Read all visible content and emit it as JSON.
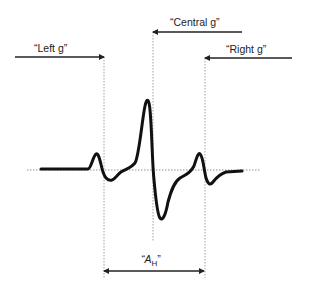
{
  "diagram": {
    "type": "waveform-annotation",
    "labels": {
      "left_g": "“Left g”",
      "central_g": "“Central g”",
      "right_g": "“Right g”",
      "a_h_open": "“A",
      "a_h_sub": "H",
      "a_h_close": "”"
    },
    "regions": [
      {
        "name": "Left g",
        "arrow_direction": "right",
        "boundary": "left-dotted-line"
      },
      {
        "name": "Central g",
        "arrow_direction": "left",
        "boundary": "central-dotted-line"
      },
      {
        "name": "Right g",
        "arrow_direction": "left",
        "boundary": "right-dotted-line"
      }
    ],
    "span_annotation": {
      "name": "A_H",
      "from": "left-dotted-line",
      "to": "right-dotted-line",
      "double_headed": true
    },
    "colors": {
      "curve": "#111111",
      "guides": "#888888",
      "arrows": "#222222",
      "background": "#ffffff"
    }
  }
}
